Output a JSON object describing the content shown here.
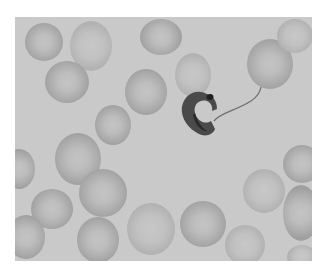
{
  "image": {
    "description": "Grayscale light micrograph of a blood smear showing a trypanosome parasite among red blood cells",
    "subject": "trypanosome",
    "background": "red blood cells",
    "colors": {
      "background_field": "#c9c9c9",
      "cell": "#a9a9a9",
      "parasite": "#3a3a3a",
      "page": "#ffffff"
    }
  }
}
